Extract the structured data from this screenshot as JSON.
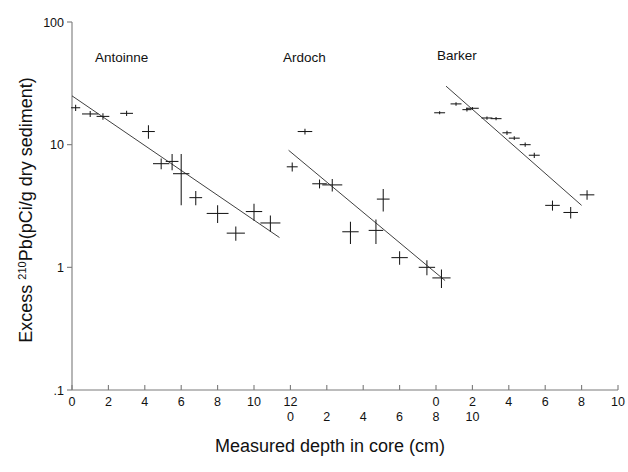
{
  "figure": {
    "background": "#ffffff",
    "ink": "#1a1a1a",
    "axis_color": "#7a7a7a"
  },
  "axes": {
    "y_title_main": "Excess ",
    "y_title_sup": "210",
    "y_title_rest": "Pb(pCi/g dry sediment)",
    "y_title_full": "Excess 210Pb(pCi/g dry sediment)",
    "x_title": "Measured depth in core (cm)",
    "y_scale": "log",
    "y_ticks": [
      {
        "label": "100",
        "value": 100
      },
      {
        "label": "10",
        "value": 10
      },
      {
        "label": "1",
        "value": 1
      },
      {
        "label": ".1",
        "value": 0.1
      }
    ],
    "y_range": [
      0.1,
      100
    ],
    "x_range_px": [
      0,
      10
    ],
    "x_tick_rows": [
      {
        "row": 1,
        "labels": [
          "0",
          "2",
          "4",
          "6",
          "8",
          "10",
          "12",
          "",
          "",
          "",
          "0",
          "2",
          "4",
          "6",
          "8",
          "10"
        ]
      },
      {
        "row": 2,
        "labels": [
          "",
          "",
          "",
          "",
          "",
          "",
          "0",
          "2",
          "4",
          "6",
          "8",
          "10",
          "",
          "",
          "",
          ""
        ]
      }
    ],
    "n_ticks": 16,
    "grid": false
  },
  "chart_data": {
    "type": "scatter",
    "title": "",
    "xlabel": "Measured depth in core (cm)",
    "ylabel": "Excess 210Pb(pCi/g dry sediment)",
    "yscale": "log",
    "ylim": [
      0.1,
      100
    ],
    "panels": [
      {
        "name": "Antoinne",
        "label_x": 95,
        "label_y": 62,
        "x_axis_origin_tick": 0,
        "x_axis_end_tick": 12,
        "points": [
          {
            "x": 0.2,
            "y": 20.0,
            "xerr": 0.25,
            "yerr": 1.2
          },
          {
            "x": 1.0,
            "y": 17.8,
            "xerr": 0.45,
            "yerr": 1.0
          },
          {
            "x": 1.7,
            "y": 17.0,
            "xerr": 0.35,
            "yerr": 1.0
          },
          {
            "x": 3.0,
            "y": 18.0,
            "xerr": 0.35,
            "yerr": 0.9
          },
          {
            "x": 4.2,
            "y": 12.8,
            "xerr": 0.35,
            "yerr": 1.6
          },
          {
            "x": 4.9,
            "y": 7.0,
            "xerr": 0.45,
            "yerr": 0.7
          },
          {
            "x": 5.5,
            "y": 7.3,
            "xerr": 0.35,
            "yerr": 1.1
          },
          {
            "x": 6.0,
            "y": 5.8,
            "xerr": 0.45,
            "yerr": 2.6
          },
          {
            "x": 6.8,
            "y": 3.7,
            "xerr": 0.35,
            "yerr": 0.5
          },
          {
            "x": 8.0,
            "y": 2.75,
            "xerr": 0.6,
            "yerr": 0.45
          },
          {
            "x": 9.0,
            "y": 1.9,
            "xerr": 0.5,
            "yerr": 0.25
          },
          {
            "x": 10.0,
            "y": 2.85,
            "xerr": 0.45,
            "yerr": 0.45
          },
          {
            "x": 10.9,
            "y": 2.3,
            "xerr": 0.55,
            "yerr": 0.35
          }
        ],
        "fit_line": {
          "x0": 0.0,
          "y0": 25.0,
          "x1": 11.4,
          "y1": 1.75
        }
      },
      {
        "name": "Ardoch",
        "label_x": 283,
        "label_y": 62,
        "x_axis_origin_tick": 0,
        "x_axis_end_tick": 10,
        "points": [
          {
            "x": 0.8,
            "y": 12.8,
            "xerr": 0.4,
            "yerr": 0.7
          },
          {
            "x": 0.1,
            "y": 6.6,
            "xerr": 0.3,
            "yerr": 0.55
          },
          {
            "x": 1.6,
            "y": 4.8,
            "xerr": 0.4,
            "yerr": 0.4
          },
          {
            "x": 2.3,
            "y": 4.7,
            "xerr": 0.55,
            "yerr": 0.55
          },
          {
            "x": 3.3,
            "y": 1.95,
            "xerr": 0.45,
            "yerr": 0.4
          },
          {
            "x": 4.7,
            "y": 2.0,
            "xerr": 0.4,
            "yerr": 0.45
          },
          {
            "x": 5.1,
            "y": 3.6,
            "xerr": 0.35,
            "yerr": 0.75
          },
          {
            "x": 6.0,
            "y": 1.2,
            "xerr": 0.45,
            "yerr": 0.15
          },
          {
            "x": 7.5,
            "y": 1.0,
            "xerr": 0.45,
            "yerr": 0.14
          },
          {
            "x": 8.3,
            "y": 0.82,
            "xerr": 0.5,
            "yerr": 0.14
          }
        ],
        "fit_line": {
          "x0": -0.1,
          "y0": 9.0,
          "x1": 8.5,
          "y1": 0.78
        }
      },
      {
        "name": "Barker",
        "label_x": 437,
        "label_y": 60,
        "x_axis_origin_tick": 0,
        "x_axis_end_tick": 10,
        "points": [
          {
            "x": 0.2,
            "y": 18.2,
            "xerr": 0.3,
            "yerr": 0.5
          },
          {
            "x": 1.1,
            "y": 21.5,
            "xerr": 0.3,
            "yerr": 0.7
          },
          {
            "x": 1.7,
            "y": 19.3,
            "xerr": 0.25,
            "yerr": 0.7
          },
          {
            "x": 2.0,
            "y": 19.8,
            "xerr": 0.35,
            "yerr": 0.5
          },
          {
            "x": 2.8,
            "y": 16.5,
            "xerr": 0.3,
            "yerr": 0.5
          },
          {
            "x": 3.3,
            "y": 16.3,
            "xerr": 0.3,
            "yerr": 0.5
          },
          {
            "x": 3.9,
            "y": 12.5,
            "xerr": 0.25,
            "yerr": 0.5
          },
          {
            "x": 4.3,
            "y": 11.3,
            "xerr": 0.3,
            "yerr": 0.4
          },
          {
            "x": 4.9,
            "y": 10.0,
            "xerr": 0.3,
            "yerr": 0.4
          },
          {
            "x": 5.4,
            "y": 8.2,
            "xerr": 0.3,
            "yerr": 0.4
          },
          {
            "x": 6.4,
            "y": 3.2,
            "xerr": 0.4,
            "yerr": 0.3
          },
          {
            "x": 7.4,
            "y": 2.8,
            "xerr": 0.4,
            "yerr": 0.3
          },
          {
            "x": 8.3,
            "y": 3.9,
            "xerr": 0.4,
            "yerr": 0.35
          }
        ],
        "fit_line": {
          "x0": 0.55,
          "y0": 30.0,
          "x1": 8.0,
          "y1": 3.2
        }
      }
    ]
  }
}
